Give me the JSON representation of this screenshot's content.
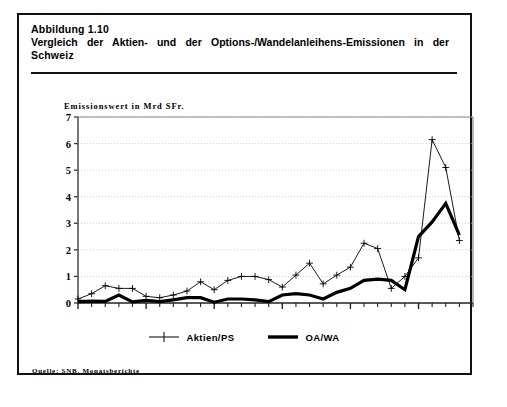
{
  "figure": {
    "number_line": "Abbildung 1.10",
    "title_line_1": "Vergleich der Aktien- und der Options-/Wandelanleihens-Emissionen in der",
    "title_line_2": "Schweiz",
    "source": "Quelle: SNB. Monatsberichte"
  },
  "axis": {
    "y_title": "Emissionswert in Mrd SFr.",
    "y_ticks": [
      "0",
      "1",
      "2",
      "3",
      "4",
      "5",
      "6",
      "7"
    ],
    "x_ticks": [
      "1960",
      "1965",
      "1970",
      "1975",
      "1980",
      "1985"
    ]
  },
  "legend": {
    "items": [
      {
        "label": "Aktien/PS",
        "style": "thin-plus-marker",
        "color": "#000000"
      },
      {
        "label": "OA/WA",
        "style": "thick-line",
        "color": "#000000"
      }
    ]
  },
  "chart_data": {
    "type": "line",
    "title": "Vergleich der Aktien- und der Options-/Wandelanleihens-Emissionen in der Schweiz",
    "subtitle": "Abbildung 1.10",
    "xlabel": "",
    "ylabel": "Emissionswert in Mrd SFr.",
    "xlim": [
      1960,
      1989
    ],
    "ylim": [
      0,
      7
    ],
    "grid": true,
    "legend_position": "below-center",
    "x": [
      1960,
      1961,
      1962,
      1963,
      1964,
      1965,
      1966,
      1967,
      1968,
      1969,
      1970,
      1971,
      1972,
      1973,
      1974,
      1975,
      1976,
      1977,
      1978,
      1979,
      1980,
      1981,
      1982,
      1983,
      1984,
      1985,
      1986,
      1987,
      1988
    ],
    "series": [
      {
        "name": "Aktien/PS",
        "marker": "plus",
        "width": "thin",
        "values": [
          0.15,
          0.35,
          0.65,
          0.55,
          0.55,
          0.25,
          0.2,
          0.3,
          0.45,
          0.8,
          0.5,
          0.85,
          1.0,
          1.0,
          0.88,
          0.6,
          1.05,
          1.5,
          0.72,
          1.05,
          1.35,
          2.25,
          2.05,
          0.55,
          1.0,
          1.7,
          6.15,
          5.1,
          2.35
        ]
      },
      {
        "name": "OA/WA",
        "marker": "none",
        "width": "thick",
        "values": [
          0.05,
          0.07,
          0.06,
          0.3,
          0.04,
          0.1,
          0.05,
          0.12,
          0.2,
          0.2,
          0.03,
          0.15,
          0.15,
          0.12,
          0.05,
          0.3,
          0.35,
          0.3,
          0.15,
          0.4,
          0.55,
          0.85,
          0.9,
          0.85,
          0.5,
          2.5,
          3.05,
          3.75,
          2.55
        ]
      }
    ]
  }
}
